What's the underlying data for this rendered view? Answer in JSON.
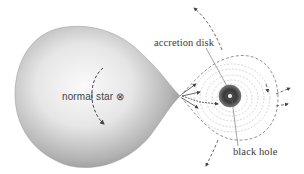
{
  "labels": {
    "normal_star": "normal star ⊗",
    "accretion_disk": "accretion disk",
    "black_hole": "black hole"
  },
  "colors": {
    "star_light": "#f4f4f4",
    "star_dark": "#8a8a8a",
    "disk_lines": "#9a9a9a",
    "arrows": "#444444",
    "black_hole": "#2a2a2a"
  }
}
